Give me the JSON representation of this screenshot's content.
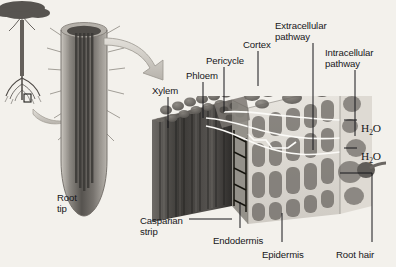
{
  "figure": {
    "background_color": "#f3f1ec",
    "ink_color": "#17171a"
  },
  "labels": [
    {
      "id": "root-tip",
      "text": "Root\ntip",
      "x": 57,
      "y": 193
    },
    {
      "id": "xylem",
      "text": "Xylem",
      "x": 152,
      "y": 86
    },
    {
      "id": "phloem",
      "text": "Phloem",
      "x": 186,
      "y": 71
    },
    {
      "id": "pericycle",
      "text": "Pericycle",
      "x": 206,
      "y": 56
    },
    {
      "id": "cortex",
      "text": "Cortex",
      "x": 243,
      "y": 40
    },
    {
      "id": "extracellular-pathway",
      "text": "Extracellular\npathway",
      "x": 275,
      "y": 21
    },
    {
      "id": "intracellular-pathway",
      "text": "Intracellular\npathway",
      "x": 325,
      "y": 48
    },
    {
      "id": "water-upper",
      "text": "H2O",
      "x": 361,
      "y": 123
    },
    {
      "id": "water-lower",
      "text": "H2O",
      "x": 361,
      "y": 151
    },
    {
      "id": "casparian-strip",
      "text": "Casparian\nstrip",
      "x": 140,
      "y": 216
    },
    {
      "id": "endodermis",
      "text": "Endodermis",
      "x": 213,
      "y": 236
    },
    {
      "id": "epidermis",
      "text": "Epidermis",
      "x": 262,
      "y": 250
    },
    {
      "id": "root-hair",
      "text": "Root hair",
      "x": 336,
      "y": 250
    }
  ],
  "leaders": [
    {
      "id": "xylem-leader",
      "x1": 168,
      "y1": 97,
      "x2": 168,
      "y2": 128
    },
    {
      "id": "phloem-leader",
      "x1": 203,
      "y1": 82,
      "x2": 203,
      "y2": 118
    },
    {
      "id": "pericycle-leader",
      "x1": 224,
      "y1": 67,
      "x2": 224,
      "y2": 112
    },
    {
      "id": "cortex-leader",
      "x1": 258,
      "y1": 51,
      "x2": 258,
      "y2": 86
    },
    {
      "id": "extracellular-leader",
      "x1": 313,
      "y1": 43,
      "x2": 313,
      "y2": 150
    },
    {
      "id": "intracellular-leader",
      "x1": 355,
      "y1": 70,
      "x2": 355,
      "y2": 136
    },
    {
      "id": "water-upper-leader",
      "x1": 344,
      "y1": 120,
      "x2": 357,
      "y2": 120
    },
    {
      "id": "water-lower-leader",
      "x1": 344,
      "y1": 148,
      "x2": 357,
      "y2": 148
    },
    {
      "id": "casparian-leader",
      "x1": 189,
      "y1": 219,
      "x2": 232,
      "y2": 219
    },
    {
      "id": "endodermis-leader",
      "x1": 240,
      "y1": 202,
      "x2": 240,
      "y2": 228
    },
    {
      "id": "epidermis-leader",
      "x1": 282,
      "y1": 213,
      "x2": 282,
      "y2": 242
    },
    {
      "id": "root-hair-leader-vert",
      "x1": 372,
      "y1": 173,
      "x2": 372,
      "y2": 242
    },
    {
      "id": "root-hair-leader-horiz",
      "x1": 340,
      "y1": 173,
      "x2": 372,
      "y2": 173
    }
  ],
  "scene": {
    "tree": {
      "name": "whole-plant-tree",
      "canopy": "dark spreading crown",
      "trunk": "vertical",
      "roots": "fibrous root mass"
    },
    "inset_box": {
      "name": "root-region-callout-box",
      "x": 24,
      "y": 94,
      "w": 7,
      "h": 8
    },
    "arrow_small": {
      "name": "magnify-arrow-from-tree",
      "description": "curved block arrow from root box to root tip"
    },
    "arrow_large": {
      "name": "magnify-arrow-from-root-tip",
      "description": "curved tapering arrow from root tip to cell block"
    },
    "root_tip": {
      "name": "root-tip-cylinder",
      "description": "cut-away cylindrical root tip with root hairs"
    },
    "cell_block": {
      "name": "root-cross-section-block",
      "description": "3D cutaway showing xylem vessels, endodermis with Casparian strip, cortex, epidermis and root hair"
    }
  }
}
